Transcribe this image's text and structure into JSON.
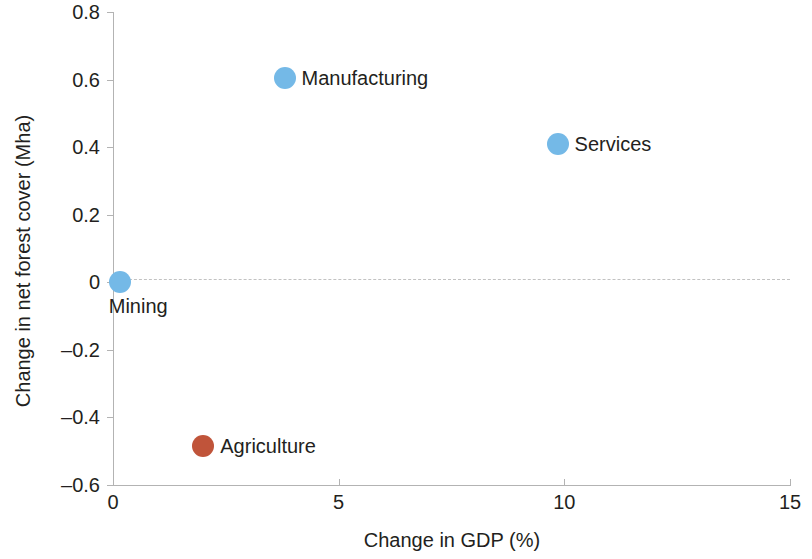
{
  "chart_data": {
    "type": "scatter",
    "title": "",
    "xlabel": "Change in GDP (%)",
    "ylabel": "Change in net forest cover (Mha)",
    "xlim": [
      0,
      15
    ],
    "ylim": [
      -0.6,
      0.8
    ],
    "xticks": [
      "0",
      "5",
      "10",
      "15"
    ],
    "xtick_values": [
      0,
      5,
      10,
      15
    ],
    "yticks": [
      "0.8",
      "0.6",
      "0.4",
      "0.2",
      "0",
      "–0.2",
      "–0.4",
      "–0.6"
    ],
    "ytick_values": [
      0.8,
      0.6,
      0.4,
      0.2,
      0,
      -0.2,
      -0.4,
      -0.6
    ],
    "grid": false,
    "legend": "none",
    "reference_lines": [
      {
        "name": "zero-line",
        "axis": "y",
        "value": 0,
        "style": "dashed",
        "color": "#c2c2c2"
      }
    ],
    "colors": {
      "blue": "#74b9e7",
      "red": "#c0543a",
      "axis": "#b3b3b3",
      "text": "#231f20",
      "background": "#ffffff"
    },
    "points": [
      {
        "label": "Mining",
        "x": 0.15,
        "y": 0.0,
        "color": "#74b9e7",
        "label_position": "below"
      },
      {
        "label": "Manufacturing",
        "x": 3.8,
        "y": 0.605,
        "color": "#74b9e7",
        "label_position": "right"
      },
      {
        "label": "Services",
        "x": 9.85,
        "y": 0.41,
        "color": "#74b9e7",
        "label_position": "right"
      },
      {
        "label": "Agriculture",
        "x": 2.0,
        "y": -0.485,
        "color": "#c0543a",
        "label_position": "right"
      }
    ]
  }
}
